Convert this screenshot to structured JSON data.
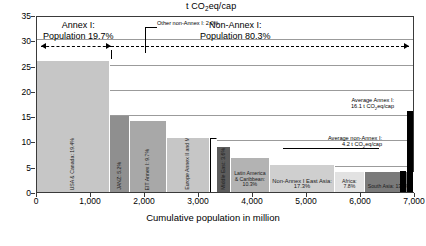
{
  "chart_data": {
    "type": "bar",
    "title": "t CO2eq/cap",
    "title_parts": {
      "pre": "t CO",
      "sub": "2",
      "post": "eq/cap"
    },
    "xlabel": "Cumulative population in million",
    "ylabel": "",
    "xlim": [
      0,
      7000
    ],
    "ylim": [
      0,
      35
    ],
    "xticks": [
      "0",
      "1,000",
      "2,000",
      "3,000",
      "4,000",
      "5,000",
      "6,000",
      "7,000"
    ],
    "xtick_values": [
      0,
      1000,
      2000,
      3000,
      4000,
      5000,
      6000,
      7000
    ],
    "yticks": [
      "0",
      "5",
      "10",
      "15",
      "20",
      "25",
      "30",
      "35"
    ],
    "ytick_values": [
      0,
      5,
      10,
      15,
      20,
      25,
      30,
      35
    ],
    "grid": "horizontal",
    "legend": "none",
    "note": "Variable-width (Marimekko) bar chart: bar width = share of world population, bar height = per-capita GHG emissions in t CO2eq/cap",
    "categories": [
      {
        "name": "USA & Canada",
        "label": "USA & Canada: 19.4%",
        "pop_share_pct": 19.4,
        "value": 26.0,
        "color": "#c6c6c6",
        "orient": "vert"
      },
      {
        "name": "JANZ",
        "label": "JANZ: 5.2%",
        "pop_share_pct": 5.2,
        "value": 15.0,
        "color": "#8f8f8f",
        "orient": "vert"
      },
      {
        "name": "EIT Annex I",
        "label": "EIT Annex I: 9.7%",
        "pop_share_pct": 9.7,
        "value": 14.0,
        "color": "#a8a8a8",
        "orient": "vert"
      },
      {
        "name": "Europe Annex II and M & T",
        "label": "Europe Annex II and M & T: 11.4%",
        "pop_share_pct": 11.4,
        "value": 10.6,
        "color": "#c6c6c6",
        "orient": "vert"
      },
      {
        "name": "Other non-Annex I",
        "label": "Other non-Annex I: 2.0%",
        "pop_share_pct": 2.0,
        "value": 10.6,
        "color": "#ffffff",
        "orient": "callout"
      },
      {
        "name": "Middle East",
        "label": "Middle East: 3.6%",
        "pop_share_pct": 3.6,
        "value": 8.9,
        "color": "#5c5c5c",
        "orient": "vert"
      },
      {
        "name": "Latin America & Caribbean",
        "label": "Latin America & Caribbean: 10.3%",
        "pop_share_pct": 10.3,
        "value": 6.8,
        "color": "#b3b3b3",
        "orient": "horiz"
      },
      {
        "name": "Non-Annex I East Asia",
        "label": "Non-Annex I East Asia: 17.3%",
        "pop_share_pct": 17.3,
        "value": 5.3,
        "color": "#cfcfcf",
        "orient": "horiz"
      },
      {
        "name": "Africa",
        "label": "Africa: 7.8%",
        "pop_share_pct": 7.8,
        "value": 4.0,
        "color": "#e2e2e2",
        "orient": "horiz"
      },
      {
        "name": "South Asia",
        "label": "South Asia: 13.1%",
        "pop_share_pct": 13.1,
        "value": 3.9,
        "color": "#7a7a7a",
        "orient": "horiz"
      }
    ],
    "reference_bars": [
      {
        "name": "Average non-Annex I",
        "value": 4.2,
        "color": "#000000"
      },
      {
        "name": "Average Annex I",
        "value": 16.1,
        "color": "#000000"
      }
    ],
    "annotations": {
      "annex1_band": {
        "text_line1": "Annex I:",
        "text_line2": "Population 19.7%",
        "pop_share_pct": 19.7
      },
      "nonannex1_band": {
        "text_line1": "Non-Annex I:",
        "text_line2": "Population 80.3%",
        "pop_share_pct": 80.3
      },
      "avg_annex1": {
        "line1": "Average Annex I:",
        "line2_pre": "16.1 t CO",
        "line2_sub": "2",
        "line2_post": "eq/cap"
      },
      "avg_nonannex1": {
        "line1": "Average non-Annex I:",
        "line2_pre": "4.2 t CO",
        "line2_sub": "2",
        "line2_post": "eq/cap"
      },
      "other_nonannex1": {
        "text": "Other non-Annex I: 2.0%"
      }
    }
  }
}
